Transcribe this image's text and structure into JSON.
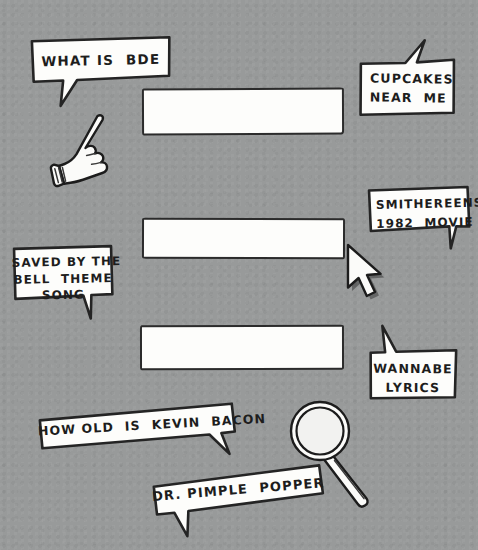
{
  "scene": {
    "title": "Hand-drawn search queries illustration",
    "background_color": "#989a9a",
    "ink_color": "#1d1d1d",
    "paper_color": "#fdfdfb",
    "width": 478,
    "height": 550
  },
  "search_bars": [
    {
      "name": "search-bar-top",
      "value": "",
      "placeholder": ""
    },
    {
      "name": "search-bar-middle",
      "value": "",
      "placeholder": ""
    },
    {
      "name": "search-bar-bottom",
      "value": "",
      "placeholder": ""
    }
  ],
  "bubbles": {
    "bde": {
      "line1": "WHAT IS  BDE"
    },
    "cupcakes": {
      "line1": "CUPCAKES",
      "line2": "NEAR  ME"
    },
    "smithereens": {
      "line1": "SMITHEREENS",
      "line2": "1982  MOVIE"
    },
    "saved": {
      "line1": "SAVED BY THE",
      "line2": "BELL  THEME",
      "line3": "SONG"
    },
    "wannabe": {
      "line1": "WANNABE",
      "line2": "LYRICS"
    },
    "bacon": {
      "line1": "HOW OLD  IS  KEVIN  BACON"
    },
    "pimple": {
      "line1": "DR. PIMPLE  POPPER"
    }
  },
  "icons": {
    "hand": "pointing-hand-cursor-icon",
    "arrow": "arrow-cursor-icon",
    "magnifier": "magnifying-glass-icon"
  }
}
